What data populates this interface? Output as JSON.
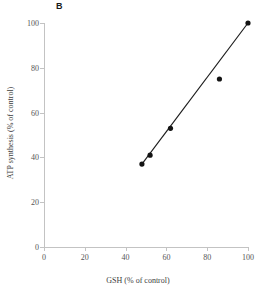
{
  "panel": {
    "label": "B"
  },
  "chart_data": {
    "type": "scatter",
    "title": "",
    "panel_label": "B",
    "xlabel": "GSH (% of control)",
    "ylabel": "ATP synthesis (% of control)",
    "xlim": [
      0,
      100
    ],
    "ylim": [
      0,
      100
    ],
    "xticks": [
      0,
      20,
      40,
      60,
      80,
      100
    ],
    "yticks": [
      0,
      20,
      40,
      60,
      80,
      100
    ],
    "xtick_labels": [
      "0",
      "20",
      "40",
      "60",
      "80",
      "100"
    ],
    "ytick_labels": [
      "0",
      "20",
      "40",
      "60",
      "80",
      "100"
    ],
    "grid": false,
    "legend": "none",
    "marker": "filled-circle",
    "marker_color": "#131313",
    "line_color": "#1b1b1b",
    "axis_color": "#c3c3c3",
    "background_color": "#ffffff",
    "series": [
      {
        "name": "ATP synthesis vs GSH",
        "x": [
          48,
          52,
          62,
          86,
          100
        ],
        "y": [
          37,
          41,
          53,
          75,
          100
        ]
      }
    ],
    "fit_line": {
      "x": [
        48,
        100
      ],
      "y": [
        37,
        100
      ]
    },
    "annotations": []
  }
}
